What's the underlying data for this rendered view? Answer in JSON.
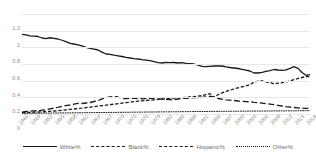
{
  "chart_data": {
    "type": "line",
    "title": "",
    "subtitle": "",
    "xlabel": "",
    "ylabel": "",
    "ylim": [
      0,
      1.2
    ],
    "yticks": [
      "0",
      "0.2",
      "0.4",
      "0.6",
      "0.8",
      "1",
      "1.2"
    ],
    "grid": true,
    "legend_position": "bottom",
    "x": [
      "1946",
      "1947",
      "1948",
      "1949",
      "1950",
      "1951",
      "1952",
      "1953",
      "1954",
      "1955",
      "1956",
      "1957",
      "1958",
      "1959",
      "1960",
      "1961",
      "1962",
      "1963",
      "1964",
      "1965",
      "1966",
      "1967",
      "1968",
      "1969",
      "1970",
      "1971",
      "1972",
      "1973",
      "1974",
      "1975",
      "1976",
      "1977",
      "1978",
      "1979",
      "1980",
      "1981",
      "1982",
      "1983",
      "1984",
      "1985",
      "1986",
      "1987",
      "1988",
      "1989",
      "1990",
      "1991",
      "1992",
      "1993",
      "1994",
      "1995",
      "1996",
      "1997",
      "1998",
      "1999",
      "2000",
      "2001",
      "2002",
      "2003",
      "2004",
      "2005",
      "2006",
      "2007",
      "2008",
      "2009",
      "2010",
      "2011",
      "2012",
      "2013",
      "2014",
      "2015",
      "2016",
      "2017",
      "2018"
    ],
    "xtick_labels": [
      "1946",
      "1949",
      "1952",
      "1955",
      "1958",
      "1961",
      "1964",
      "1967",
      "1970",
      "1973",
      "1976",
      "1979",
      "1982",
      "1985",
      "1988",
      "1991",
      "1994",
      "1997",
      "2000",
      "2003",
      "2006",
      "2009",
      "2012",
      "2015",
      "2018"
    ],
    "series": [
      {
        "name": "White%",
        "style": "solid",
        "color": "#1a1a1a",
        "values": [
          0.955,
          0.95,
          0.938,
          0.935,
          0.93,
          0.912,
          0.905,
          0.915,
          0.908,
          0.9,
          0.885,
          0.868,
          0.848,
          0.84,
          0.83,
          0.818,
          0.8,
          0.788,
          0.778,
          0.768,
          0.742,
          0.72,
          0.716,
          0.706,
          0.698,
          0.69,
          0.68,
          0.672,
          0.664,
          0.66,
          0.652,
          0.646,
          0.64,
          0.628,
          0.616,
          0.612,
          0.62,
          0.616,
          0.618,
          0.612,
          0.616,
          0.608,
          0.604,
          0.6,
          0.586,
          0.572,
          0.568,
          0.572,
          0.576,
          0.578,
          0.576,
          0.566,
          0.558,
          0.552,
          0.546,
          0.536,
          0.526,
          0.516,
          0.492,
          0.492,
          0.5,
          0.512,
          0.52,
          0.534,
          0.528,
          0.524,
          0.53,
          0.548,
          0.568,
          0.548,
          0.498,
          0.464,
          0.472
        ]
      },
      {
        "name": "Black%",
        "style": "dashed-long",
        "color": "#1a1a1a",
        "values": [
          0.022,
          0.03,
          0.035,
          0.038,
          0.04,
          0.046,
          0.052,
          0.062,
          0.07,
          0.08,
          0.092,
          0.1,
          0.108,
          0.118,
          0.128,
          0.126,
          0.132,
          0.138,
          0.15,
          0.16,
          0.182,
          0.196,
          0.206,
          0.21,
          0.204,
          0.186,
          0.184,
          0.188,
          0.19,
          0.186,
          0.182,
          0.186,
          0.19,
          0.182,
          0.178,
          0.18,
          0.176,
          0.172,
          0.17,
          0.18,
          0.186,
          0.188,
          0.192,
          0.196,
          0.196,
          0.2,
          0.206,
          0.212,
          0.206,
          0.186,
          0.178,
          0.17,
          0.166,
          0.162,
          0.156,
          0.152,
          0.148,
          0.146,
          0.14,
          0.136,
          0.13,
          0.124,
          0.118,
          0.112,
          0.104,
          0.096,
          0.088,
          0.082,
          0.078,
          0.074,
          0.07,
          0.068,
          0.066
        ]
      },
      {
        "name": "Hispanic%",
        "style": "dashed-med",
        "color": "#1a1a1a",
        "values": [
          0.016,
          0.018,
          0.02,
          0.022,
          0.024,
          0.026,
          0.03,
          0.032,
          0.036,
          0.04,
          0.044,
          0.05,
          0.056,
          0.06,
          0.066,
          0.07,
          0.076,
          0.082,
          0.088,
          0.094,
          0.1,
          0.106,
          0.112,
          0.118,
          0.124,
          0.13,
          0.136,
          0.142,
          0.148,
          0.154,
          0.158,
          0.162,
          0.166,
          0.17,
          0.176,
          0.18,
          0.182,
          0.186,
          0.19,
          0.194,
          0.196,
          0.2,
          0.204,
          0.208,
          0.214,
          0.22,
          0.232,
          0.244,
          0.198,
          0.232,
          0.254,
          0.272,
          0.286,
          0.3,
          0.314,
          0.326,
          0.338,
          0.352,
          0.382,
          0.394,
          0.398,
          0.386,
          0.378,
          0.362,
          0.37,
          0.376,
          0.384,
          0.398,
          0.412,
          0.426,
          0.438,
          0.45,
          0.448
        ]
      },
      {
        "name": "Other%",
        "style": "dotted",
        "color": "#1a1a1a",
        "values": [
          0.008,
          0.008,
          0.009,
          0.009,
          0.01,
          0.01,
          0.011,
          0.011,
          0.012,
          0.012,
          0.013,
          0.013,
          0.014,
          0.014,
          0.015,
          0.015,
          0.016,
          0.016,
          0.017,
          0.017,
          0.018,
          0.018,
          0.019,
          0.019,
          0.02,
          0.02,
          0.021,
          0.021,
          0.022,
          0.022,
          0.023,
          0.023,
          0.024,
          0.024,
          0.025,
          0.025,
          0.026,
          0.026,
          0.027,
          0.027,
          0.028,
          0.028,
          0.029,
          0.029,
          0.03,
          0.03,
          0.03,
          0.031,
          0.031,
          0.032,
          0.032,
          0.032,
          0.033,
          0.033,
          0.034,
          0.034,
          0.034,
          0.035,
          0.035,
          0.035,
          0.036,
          0.036,
          0.036,
          0.037,
          0.037,
          0.037,
          0.038,
          0.038,
          0.038,
          0.039,
          0.039,
          0.04,
          0.04
        ]
      }
    ]
  },
  "legend": {
    "items": [
      {
        "label": "White%",
        "key": "solid-line-key"
      },
      {
        "label": "Black%",
        "key": "long-dash-line-key"
      },
      {
        "label": "Hispanic%",
        "key": "medium-dash-line-key"
      },
      {
        "label": "Other%",
        "key": "dotted-line-key"
      }
    ]
  }
}
